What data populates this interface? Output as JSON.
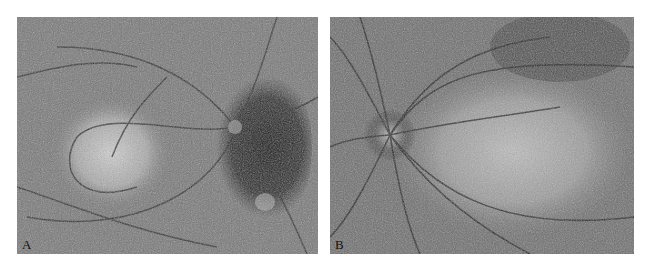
{
  "figure": {
    "panels": [
      {
        "id": "A",
        "label": "A",
        "description": "Fundus autofluorescence image with a bright central macular area surrounded by a dark crescent band on the right toward the optic disc; retinal vessels branching across the field"
      },
      {
        "id": "B",
        "label": "B",
        "description": "Fundus autofluorescence image with optic disc on the left, vessels radiating from it, and a broad mottled bright region in the center-right"
      }
    ],
    "colors": {
      "background": "#ffffff",
      "label": "#111111"
    }
  }
}
